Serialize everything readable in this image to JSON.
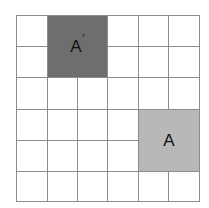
{
  "diagram": {
    "type": "grid-transformation",
    "rows": 6,
    "cols": 6,
    "colors": {
      "background": "#ffffff",
      "gridline": "#8c8c8c",
      "image_block": "#6e6e6e",
      "original_block": "#b8b8b8",
      "label": "#111111"
    },
    "blocks": [
      {
        "id": "image",
        "label": "A",
        "prime": "'",
        "row": 0,
        "col": 1,
        "row_span": 2,
        "col_span": 2,
        "fill": "#6e6e6e"
      },
      {
        "id": "original",
        "label": "A",
        "prime": "",
        "row": 3,
        "col": 4,
        "row_span": 2,
        "col_span": 2,
        "fill": "#b8b8b8"
      }
    ]
  }
}
